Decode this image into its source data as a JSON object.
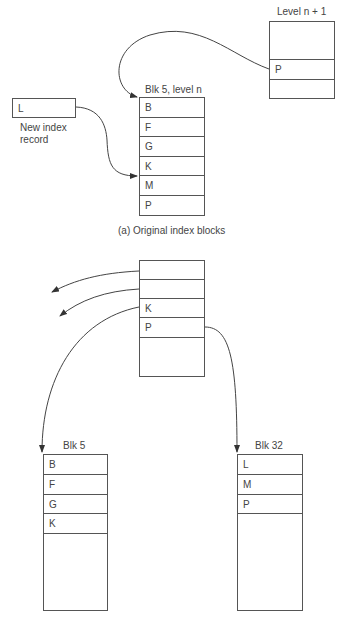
{
  "part_a": {
    "caption": "(a)  Original index blocks",
    "level_n1_block": {
      "title": "Level n + 1",
      "rows": [
        "",
        "P",
        ""
      ]
    },
    "blk5_block": {
      "title": "Blk 5, level n",
      "rows": [
        "B",
        "F",
        "G",
        "K",
        "M",
        "P"
      ]
    },
    "new_record": {
      "value": "L",
      "caption_line1": "New index",
      "caption_line2": "record"
    }
  },
  "part_b": {
    "parent_block": {
      "rows": [
        "",
        "",
        "K",
        "P",
        ""
      ]
    },
    "blk5_block": {
      "title": "Blk 5",
      "rows": [
        "B",
        "F",
        "G",
        "K",
        ""
      ]
    },
    "blk32_block": {
      "title": "Blk 32",
      "rows": [
        "L",
        "M",
        "P",
        ""
      ]
    }
  }
}
